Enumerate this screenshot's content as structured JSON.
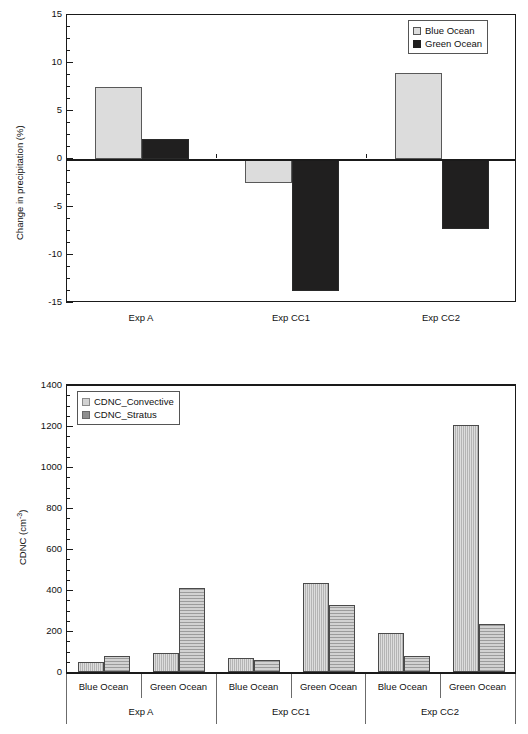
{
  "figure": {
    "panels": [
      "precipitation-change-panel",
      "cdnc-panel"
    ]
  },
  "chart_data": [
    {
      "id": "precipitation",
      "type": "bar",
      "title": "",
      "xlabel": "",
      "ylabel": "Change in precipitation (%)",
      "categories": [
        "Exp A",
        "Exp CC1",
        "Exp CC2"
      ],
      "ylim": [
        -15,
        15
      ],
      "yticks": [
        15,
        10,
        5,
        0,
        -5,
        -10,
        -15
      ],
      "ytick_labels": [
        "15",
        "10",
        "5",
        "0",
        "-5",
        "-10",
        "-15"
      ],
      "minor_tick_step": 1.25,
      "grid": false,
      "legend_position": "top-right",
      "series": [
        {
          "name": "Blue Ocean",
          "color": "#dcdcdc",
          "values": [
            7.5,
            -2.5,
            9.0
          ]
        },
        {
          "name": "Green Ocean",
          "color": "#201f1f",
          "values": [
            2.1,
            -13.8,
            -7.3
          ]
        }
      ]
    },
    {
      "id": "cdnc",
      "type": "bar",
      "title": "",
      "xlabel": "",
      "ylabel": "CDNC (cm-3)",
      "ylabel_base": "CDNC (cm",
      "ylabel_sup": "-3",
      "ylabel_tail": ")",
      "ylim": [
        0,
        1400
      ],
      "yticks": [
        0,
        200,
        400,
        600,
        800,
        1000,
        1200,
        1400
      ],
      "ytick_labels": [
        "0",
        "200",
        "400",
        "600",
        "800",
        "1000",
        "1200",
        "1400"
      ],
      "minor_tick_step": 50,
      "grid": false,
      "legend_position": "top-left",
      "groups": [
        "Exp A",
        "Exp CC1",
        "Exp CC2"
      ],
      "categories": [
        "Blue Ocean",
        "Green Ocean",
        "Blue Ocean",
        "Green Ocean",
        "Blue Ocean",
        "Green Ocean"
      ],
      "series": [
        {
          "name": "CDNC_Stratus",
          "color": "#8f8f8f",
          "values": [
            48,
            92,
            66,
            435,
            188,
            1205
          ]
        },
        {
          "name": "CDNC_Convective",
          "color": "#d2d2d2",
          "values": [
            76,
            410,
            58,
            328,
            76,
            232
          ]
        }
      ]
    }
  ]
}
